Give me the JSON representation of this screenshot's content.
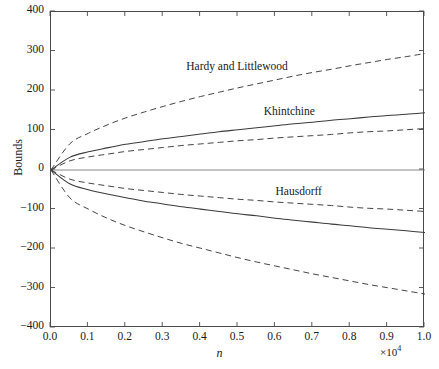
{
  "chart_data": {
    "type": "line",
    "title": "",
    "xlabel": "n",
    "ylabel": "Bounds",
    "x_multiplier": "×10",
    "x_multiplier_exp": "4",
    "xlim": [
      0.0,
      1.0
    ],
    "ylim": [
      -400,
      400
    ],
    "grid": false,
    "legend_position": "inline-annotations",
    "xticks": [
      "0.0",
      "0.1",
      "0.2",
      "0.3",
      "0.4",
      "0.5",
      "0.6",
      "0.7",
      "0.8",
      "0.9",
      "1.0"
    ],
    "xtick_values": [
      0.0,
      0.1,
      0.2,
      0.3,
      0.4,
      0.5,
      0.6,
      0.7,
      0.8,
      0.9,
      1.0
    ],
    "yticks": [
      "400",
      "300",
      "200",
      "100",
      "0",
      "−100",
      "−200",
      "−300",
      "−400"
    ],
    "ytick_values": [
      400,
      300,
      200,
      100,
      0,
      -100,
      -200,
      -300,
      -400
    ],
    "x": [
      0.0,
      0.05,
      0.1,
      0.15,
      0.2,
      0.25,
      0.3,
      0.35,
      0.4,
      0.45,
      0.5,
      0.55,
      0.6,
      0.65,
      0.7,
      0.75,
      0.8,
      0.85,
      0.9,
      0.95,
      1.0
    ],
    "series": [
      {
        "name": "Hardy and Littlewood upper",
        "label": "Hardy and Littlewood",
        "style": "dashed",
        "color": "#3b3b3b",
        "values": [
          0,
          66,
          93,
          114,
          132,
          147,
          161,
          174,
          186,
          197,
          208,
          218,
          228,
          238,
          247,
          255,
          264,
          272,
          280,
          287,
          295
        ]
      },
      {
        "name": "Khintchine upper",
        "label": "Khintchine",
        "style": "solid",
        "color": "#3b3b3b",
        "values": [
          0,
          32,
          46,
          56,
          65,
          72,
          79,
          85,
          91,
          97,
          102,
          107,
          112,
          117,
          121,
          126,
          130,
          134,
          138,
          141,
          145
        ]
      },
      {
        "name": "Hausdorff upper",
        "label": "Hausdorff",
        "style": "dashed",
        "color": "#3b3b3b",
        "values": [
          0,
          23,
          33,
          40,
          47,
          52,
          57,
          62,
          66,
          70,
          74,
          77,
          81,
          84,
          87,
          90,
          94,
          97,
          99,
          102,
          105
        ]
      },
      {
        "name": "Hausdorff lower",
        "label": "Hausdorff",
        "style": "dashed",
        "color": "#3b3b3b",
        "values": [
          0,
          -23,
          -33,
          -40,
          -47,
          -52,
          -57,
          -62,
          -66,
          -70,
          -74,
          -77,
          -81,
          -84,
          -87,
          -90,
          -94,
          -97,
          -99,
          -102,
          -105
        ]
      },
      {
        "name": "Khintchine lower",
        "label": "Khintchine",
        "style": "solid",
        "color": "#3b3b3b",
        "values": [
          0,
          -35,
          -50,
          -61,
          -70,
          -79,
          -86,
          -93,
          -99,
          -105,
          -111,
          -116,
          -122,
          -127,
          -132,
          -137,
          -141,
          -146,
          -150,
          -154,
          -158
        ]
      },
      {
        "name": "Hardy and Littlewood lower",
        "label": "Hardy and Littlewood",
        "style": "dashed",
        "color": "#3b3b3b",
        "values": [
          0,
          -70,
          -99,
          -122,
          -141,
          -157,
          -172,
          -186,
          -198,
          -210,
          -222,
          -233,
          -243,
          -253,
          -263,
          -272,
          -281,
          -290,
          -298,
          -306,
          -314
        ]
      }
    ],
    "zero_line": true,
    "annotations": [
      {
        "text": "Hardy and Littlewood",
        "x": 0.5,
        "y": 255
      },
      {
        "text": "Khintchine",
        "x": 0.64,
        "y": 142
      },
      {
        "text": "Hausdorff",
        "x": 0.665,
        "y": -62
      }
    ]
  },
  "axis_color": "#4a4a4a",
  "background": "#ffffff"
}
